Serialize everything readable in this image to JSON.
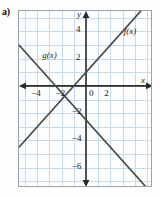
{
  "part_label": "a)",
  "chart_data": {
    "type": "line",
    "title": "",
    "xlabel": "x",
    "ylabel": "y",
    "xlim": [
      -5.5,
      5.5
    ],
    "ylim": [
      -7.5,
      5.5
    ],
    "grid": true,
    "legend": "inline-labels",
    "x_ticks": [
      -4,
      -2,
      0,
      2
    ],
    "x_tick_labels": [
      "−4",
      "−2",
      "0",
      "2"
    ],
    "y_ticks": [
      4,
      2,
      -2,
      -4,
      -6
    ],
    "y_tick_labels": [
      "4",
      "2",
      "−2",
      "−4",
      "−6"
    ],
    "axis_arrows": [
      "x-left",
      "x-right",
      "y-up",
      "y-down"
    ],
    "series": [
      {
        "name": "f(x)",
        "label": "f(x)",
        "slope": 1,
        "intercept": 1,
        "color": "#4a4a4a",
        "points": [
          [
            -5.5,
            -4.5
          ],
          [
            5.5,
            6.5
          ]
        ],
        "label_position": [
          3.1,
          4.4
        ]
      },
      {
        "name": "g(x)",
        "label": "g(x)",
        "slope": -1,
        "intercept": -2.5,
        "color": "#4a4a4a",
        "points": [
          [
            -5.5,
            3.0
          ],
          [
            5.5,
            -8.0
          ]
        ],
        "label_position": [
          -3.6,
          2.6
        ]
      }
    ],
    "intersection": [
      -1.75,
      -0.75
    ]
  },
  "colors": {
    "grid": "#c9dbe8",
    "axis": "#2b2b2b",
    "line": "#4a4a4a",
    "frame": "#9aa2ab",
    "background": "#fdfefe"
  }
}
